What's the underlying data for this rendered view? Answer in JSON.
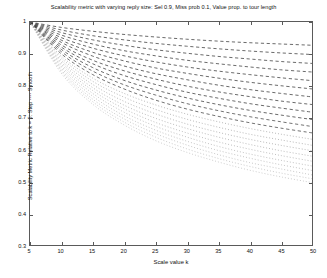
{
  "chart_data": {
    "type": "line",
    "title": "Scalability metric with varying reply size: Sel 0.9, Miss prob 0.1, Value prop. to tour length",
    "xlabel": "Scale value k",
    "ylabel": "Scalability Metric Relative to k = 5: Step ---- Smooth",
    "xlim": [
      5,
      50
    ],
    "ylim": [
      0.3,
      1
    ],
    "xticks": [
      5,
      10,
      15,
      20,
      25,
      30,
      35,
      40,
      45,
      50
    ],
    "yticks": [
      0.3,
      0.4,
      0.5,
      0.6,
      0.7,
      0.8,
      0.9,
      1
    ],
    "xtick_labels": [
      "5",
      "10",
      "15",
      "20",
      "25",
      "30",
      "35",
      "40",
      "45",
      "50"
    ],
    "ytick_labels": [
      "0.3",
      "0.4",
      "0.5",
      "0.6",
      "0.7",
      "0.8",
      "0.9",
      "1"
    ],
    "grid": false,
    "legend": "none",
    "background": "#ffffff",
    "axis_color": "#5a5a5a",
    "x": [
      5,
      10,
      15,
      20,
      25,
      30,
      35,
      40,
      45,
      50
    ],
    "series": [
      {
        "name": "reply size 1",
        "style": "dashed",
        "color": "#3a3a3a",
        "values": [
          1,
          0.983,
          0.971,
          0.961,
          0.953,
          0.946,
          0.94,
          0.935,
          0.931,
          0.927
        ]
      },
      {
        "name": "reply size 2",
        "style": "dashed",
        "color": "#3a3a3a",
        "values": [
          1,
          0.975,
          0.957,
          0.944,
          0.933,
          0.924,
          0.916,
          0.909,
          0.903,
          0.898
        ]
      },
      {
        "name": "reply size 3",
        "style": "dashed",
        "color": "#3a3a3a",
        "values": [
          1,
          0.967,
          0.944,
          0.927,
          0.913,
          0.902,
          0.892,
          0.884,
          0.876,
          0.87
        ]
      },
      {
        "name": "reply size 4",
        "style": "dashed",
        "color": "#3a3a3a",
        "values": [
          1,
          0.959,
          0.931,
          0.91,
          0.894,
          0.88,
          0.869,
          0.859,
          0.85,
          0.843
        ]
      },
      {
        "name": "reply size 5",
        "style": "dashed",
        "color": "#3a3a3a",
        "values": [
          1,
          0.951,
          0.918,
          0.894,
          0.875,
          0.859,
          0.846,
          0.835,
          0.825,
          0.816
        ]
      },
      {
        "name": "reply size 6",
        "style": "dashed",
        "color": "#3a3a3a",
        "values": [
          1,
          0.943,
          0.905,
          0.878,
          0.856,
          0.839,
          0.824,
          0.811,
          0.8,
          0.79
        ]
      },
      {
        "name": "reply size 7",
        "style": "dashed",
        "color": "#3a3a3a",
        "values": [
          1,
          0.936,
          0.893,
          0.862,
          0.838,
          0.819,
          0.802,
          0.788,
          0.776,
          0.765
        ]
      },
      {
        "name": "reply size 8",
        "style": "dashed",
        "color": "#3a3a3a",
        "values": [
          1,
          0.928,
          0.88,
          0.847,
          0.821,
          0.799,
          0.781,
          0.766,
          0.752,
          0.741
        ]
      },
      {
        "name": "reply size 9",
        "style": "dashed",
        "color": "#3a3a3a",
        "values": [
          1,
          0.921,
          0.869,
          0.832,
          0.804,
          0.78,
          0.761,
          0.744,
          0.73,
          0.717
        ]
      },
      {
        "name": "reply size 10",
        "style": "dashed",
        "color": "#3a3a3a",
        "values": [
          1,
          0.914,
          0.857,
          0.817,
          0.787,
          0.762,
          0.741,
          0.723,
          0.708,
          0.694
        ]
      },
      {
        "name": "reply size 11",
        "style": "dashed",
        "color": "#444444",
        "values": [
          1,
          0.907,
          0.846,
          0.803,
          0.771,
          0.744,
          0.722,
          0.703,
          0.687,
          0.672
        ]
      },
      {
        "name": "reply size 12",
        "style": "dashed",
        "color": "#444444",
        "values": [
          1,
          0.9,
          0.835,
          0.79,
          0.755,
          0.727,
          0.704,
          0.684,
          0.667,
          0.652
        ]
      },
      {
        "name": "reply size 13",
        "style": "dotted",
        "color": "#8a8a8a",
        "values": [
          1,
          0.893,
          0.824,
          0.776,
          0.74,
          0.711,
          0.687,
          0.666,
          0.648,
          0.632
        ]
      },
      {
        "name": "reply size 14",
        "style": "dotted",
        "color": "#8a8a8a",
        "values": [
          1,
          0.887,
          0.814,
          0.764,
          0.726,
          0.695,
          0.67,
          0.648,
          0.63,
          0.613
        ]
      },
      {
        "name": "reply size 15",
        "style": "dotted",
        "color": "#8a8a8a",
        "values": [
          1,
          0.88,
          0.804,
          0.751,
          0.712,
          0.68,
          0.654,
          0.632,
          0.613,
          0.596
        ]
      },
      {
        "name": "reply size 16",
        "style": "dotted",
        "color": "#8f8f8f",
        "values": [
          1,
          0.874,
          0.794,
          0.739,
          0.698,
          0.666,
          0.639,
          0.616,
          0.596,
          0.579
        ]
      },
      {
        "name": "reply size 17",
        "style": "dotted",
        "color": "#949494",
        "values": [
          1,
          0.868,
          0.785,
          0.728,
          0.685,
          0.652,
          0.624,
          0.601,
          0.581,
          0.563
        ]
      },
      {
        "name": "reply size 18",
        "style": "dotted",
        "color": "#999999",
        "values": [
          1,
          0.862,
          0.776,
          0.717,
          0.673,
          0.639,
          0.61,
          0.586,
          0.566,
          0.548
        ]
      },
      {
        "name": "reply size 19",
        "style": "dotted",
        "color": "#9e9e9e",
        "values": [
          1,
          0.856,
          0.767,
          0.706,
          0.661,
          0.626,
          0.597,
          0.573,
          0.552,
          0.534
        ]
      },
      {
        "name": "reply size 20",
        "style": "dotted",
        "color": "#a3a3a3",
        "values": [
          1,
          0.85,
          0.758,
          0.696,
          0.65,
          0.614,
          0.584,
          0.559,
          0.539,
          0.52
        ]
      },
      {
        "name": "reply size 21",
        "style": "dotted",
        "color": "#a8a8a8",
        "values": [
          1,
          0.845,
          0.75,
          0.686,
          0.639,
          0.602,
          0.572,
          0.547,
          0.526,
          0.508
        ]
      },
      {
        "name": "reply size 22",
        "style": "dotted",
        "color": "#adadad",
        "values": [
          1,
          0.839,
          0.742,
          0.677,
          0.628,
          0.591,
          0.561,
          0.535,
          0.514,
          0.496
        ]
      }
    ]
  }
}
